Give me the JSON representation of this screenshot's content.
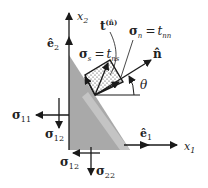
{
  "figure": {
    "colors": {
      "region": "#a9a9a9",
      "region_light": "#c2c2c2",
      "ink": "#1a1a1a",
      "background": "#ffffff"
    }
  },
  "axes": {
    "x1": {
      "label": "x",
      "sub": "1"
    },
    "x2": {
      "label": "x",
      "sub": "2"
    }
  },
  "basis": {
    "e1": {
      "label": "ê",
      "sub": "1"
    },
    "e2": {
      "label": "ê",
      "sub": "2"
    }
  },
  "vectors": {
    "traction": {
      "label": "t",
      "sup": "(n̂)"
    },
    "normal": {
      "label": "n̂"
    }
  },
  "equations": {
    "sigma_n": {
      "lhs": "σ",
      "lhs_sub": "n",
      "eq": "=",
      "rhs": "t",
      "rhs_sub": "nn"
    },
    "sigma_s": {
      "lhs": "σ",
      "lhs_sub": "s",
      "eq": "=",
      "rhs": "t",
      "rhs_sub": "ns"
    }
  },
  "angle": {
    "label": "θ"
  },
  "stress_labels": {
    "s11": {
      "label": "σ",
      "sub": "11"
    },
    "s12_left": {
      "label": "σ",
      "sub": "12"
    },
    "s12_bottom": {
      "label": "σ",
      "sub": "12"
    },
    "s22": {
      "label": "σ",
      "sub": "22"
    }
  }
}
